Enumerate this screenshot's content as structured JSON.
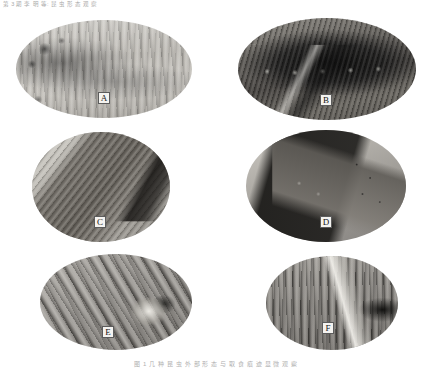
{
  "header": {
    "running_head": "第 3 期            李 明 等: 昆 虫 形 态 观 察"
  },
  "figure": {
    "caption": "图 1   几 种 昆 虫 外 部 形 态 与 取 食 痕 迹 显 微 观 察",
    "panels": [
      {
        "id": "A",
        "label": "A",
        "shape": "ellipse",
        "description": "pale-gray elongated specimen with horizontal striations"
      },
      {
        "id": "B",
        "label": "B",
        "shape": "ellipse",
        "description": "dark textured mass with a row of repeated nodules"
      },
      {
        "id": "C",
        "label": "C",
        "shape": "ellipse",
        "description": "near-circular view of an elongated diagonal specimen on pale ground"
      },
      {
        "id": "D",
        "label": "D",
        "shape": "ellipse",
        "description": "dark angular wedge forms with fine dark punctations"
      },
      {
        "id": "E",
        "label": "E",
        "shape": "ellipse",
        "description": "diagonal streaked surface with a bright specimen right of center"
      },
      {
        "id": "F",
        "label": "F",
        "shape": "ellipse",
        "description": "vertically striated dark surface with a pale pointed specimen"
      }
    ]
  },
  "colors": {
    "page_background": "#ffffff",
    "label_box_fill": "#f4f3f0",
    "label_box_border": "#5c5c5c",
    "caption_text": "#b0b0b0",
    "header_text": "#9a9a9a"
  }
}
